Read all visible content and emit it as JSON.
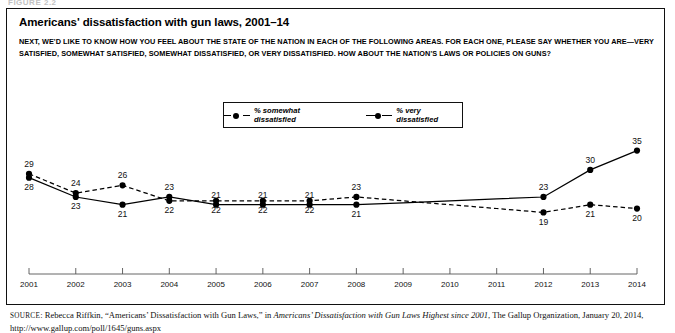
{
  "figure_label": "FIGURE 2.2",
  "title": "Americans' dissatisfaction with gun laws, 2001–14",
  "subtitle_line1": "NEXT, WE'D LIKE TO KNOW HOW YOU FEEL ABOUT THE STATE OF THE NATION IN EACH OF THE FOLLOWING AREAS. FOR EACH ONE, PLEASE SAY WHETHER YOU ARE—VERY",
  "subtitle_line2": "SATISFIED, SOMEWHAT SATISFIED, SOMEWHAT DISSATISFIED, OR VERY DISSATISFIED. HOW ABOUT THE NATION'S LAWS OR POLICIES ON GUNS?",
  "legend": {
    "items": [
      {
        "label": "% somewhat dissatisfied",
        "style": "dashed",
        "marker": "filled-circle"
      },
      {
        "label": "% very dissatisfied",
        "style": "solid",
        "marker": "filled-circle"
      }
    ]
  },
  "source": {
    "prefix": "SOURCE",
    "line1_a": ": Rebecca Riffkin, “Americans’ Dissatisfaction with Gun Laws,” in ",
    "line1_italic": "Americans’ Dissatisfaction with Gun Laws Highest since 2001",
    "line1_b": ", The Gallup",
    "line2": "Organization, January 20, 2014, http://www.gallup.com/poll/1645/guns.aspx"
  },
  "chart_data": {
    "type": "line",
    "title": "Americans' dissatisfaction with gun laws, 2001–14",
    "xlabel": "",
    "ylabel": "",
    "grid": false,
    "legend_position": "top-center",
    "categories": [
      "2001",
      "2002",
      "2003",
      "2004",
      "2005",
      "2006",
      "2007",
      "2008",
      "2009",
      "2010",
      "2011",
      "2012",
      "2013",
      "2014"
    ],
    "xlim": [
      2001,
      2014
    ],
    "ylim": [
      0,
      40
    ],
    "series": [
      {
        "name": "% somewhat dissatisfied",
        "style": "dashed",
        "color": "#000000",
        "values": [
          29,
          24,
          26,
          22,
          22,
          22,
          22,
          23,
          null,
          null,
          null,
          19,
          21,
          20
        ],
        "labels": [
          "29",
          "24",
          "26",
          "22",
          "22",
          "22",
          "22",
          "23",
          "",
          "",
          "",
          "19",
          "21",
          "20"
        ],
        "label_positions": [
          "above",
          "above",
          "above",
          "below",
          "below",
          "below",
          "below",
          "above",
          "",
          "",
          "",
          "below",
          "below",
          "below"
        ]
      },
      {
        "name": "% very dissatisfied",
        "style": "solid",
        "color": "#000000",
        "values": [
          28,
          23,
          21,
          23,
          21,
          21,
          21,
          21,
          null,
          null,
          null,
          23,
          30,
          35
        ],
        "labels": [
          "28",
          "23",
          "21",
          "23",
          "21",
          "21",
          "21",
          "21",
          "",
          "",
          "",
          "23",
          "30",
          "35"
        ],
        "label_positions": [
          "below",
          "below",
          "below",
          "above",
          "above",
          "above",
          "above",
          "below",
          "",
          "",
          "",
          "above",
          "above",
          "above"
        ]
      }
    ],
    "tick_labels": [
      "2001",
      "2002",
      "2003",
      "2004",
      "2005",
      "2006",
      "2007",
      "2008",
      "2009",
      "2010",
      "2011",
      "2012",
      "2013",
      "2014"
    ]
  }
}
